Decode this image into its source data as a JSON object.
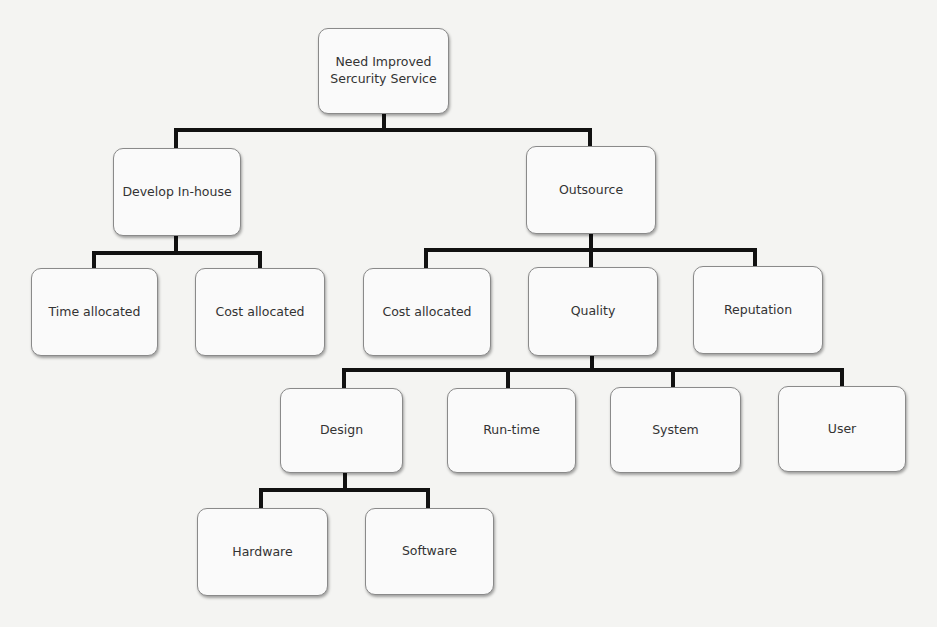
{
  "diagram": {
    "type": "hierarchy-tree",
    "root": {
      "id": "root",
      "label": "Need Improved\nSercurity Service",
      "line1": "Need Improved",
      "line2": "Sercurity Service"
    },
    "nodes": {
      "develop_inhouse": {
        "label": "Develop In-house",
        "parent": "root"
      },
      "outsource": {
        "label": "Outsource",
        "parent": "root"
      },
      "time_allocated": {
        "label": "Time allocated",
        "parent": "develop_inhouse"
      },
      "cost_allocated_inhouse": {
        "label": "Cost allocated",
        "parent": "develop_inhouse"
      },
      "cost_allocated_outsource": {
        "label": "Cost allocated",
        "parent": "outsource"
      },
      "quality": {
        "label": "Quality",
        "parent": "outsource"
      },
      "reputation": {
        "label": "Reputation",
        "parent": "outsource"
      },
      "design": {
        "label": "Design",
        "parent": "quality"
      },
      "run_time": {
        "label": "Run-time",
        "parent": "quality"
      },
      "system": {
        "label": "System",
        "parent": "quality"
      },
      "user": {
        "label": "User",
        "parent": "quality"
      },
      "hardware": {
        "label": "Hardware",
        "parent": "design"
      },
      "software": {
        "label": "Software",
        "parent": "design"
      }
    }
  }
}
